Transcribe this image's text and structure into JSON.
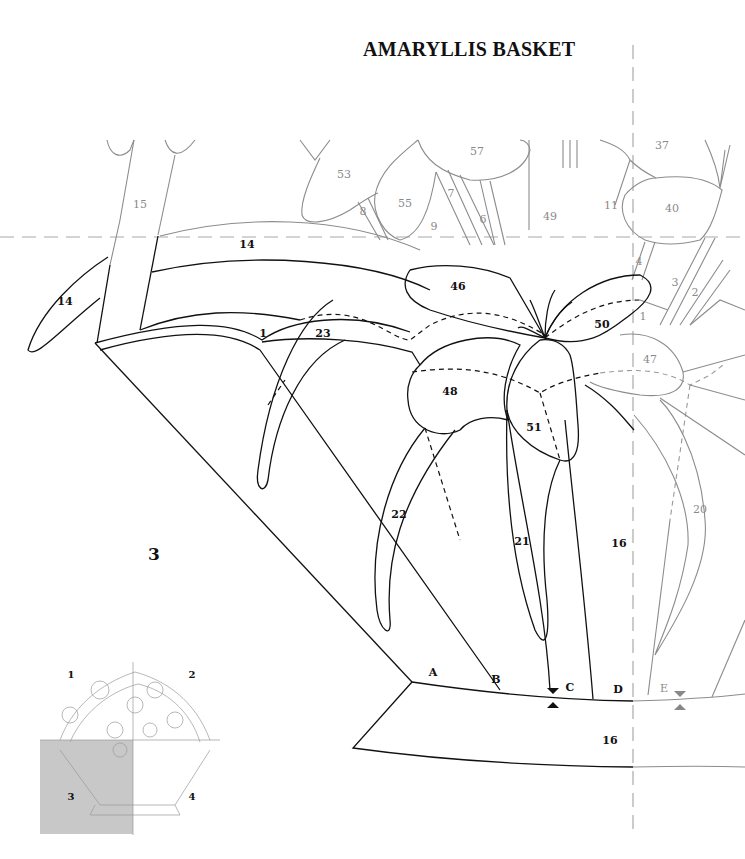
{
  "title": "AMARYLLIS BASKET",
  "section_number": "3",
  "piece_labels": {
    "black": [
      {
        "id": "p14a",
        "text": "14",
        "x": 247,
        "y": 244
      },
      {
        "id": "p14b",
        "text": "14",
        "x": 65,
        "y": 301
      },
      {
        "id": "p1",
        "text": "1",
        "x": 263,
        "y": 333
      },
      {
        "id": "p23",
        "text": "23",
        "x": 323,
        "y": 333
      },
      {
        "id": "p46",
        "text": "46",
        "x": 458,
        "y": 286
      },
      {
        "id": "p50",
        "text": "50",
        "x": 602,
        "y": 324
      },
      {
        "id": "p48",
        "text": "48",
        "x": 450,
        "y": 391
      },
      {
        "id": "p51",
        "text": "51",
        "x": 534,
        "y": 427
      },
      {
        "id": "p22",
        "text": "22",
        "x": 399,
        "y": 514
      },
      {
        "id": "p21",
        "text": "21",
        "x": 522,
        "y": 541
      },
      {
        "id": "p16a",
        "text": "16",
        "x": 619,
        "y": 543
      },
      {
        "id": "p16b",
        "text": "16",
        "x": 610,
        "y": 740
      }
    ],
    "gray": [
      {
        "id": "p15",
        "text": "15",
        "x": 140,
        "y": 204
      },
      {
        "id": "p53",
        "text": "53",
        "x": 344,
        "y": 174
      },
      {
        "id": "p57",
        "text": "57",
        "x": 477,
        "y": 151
      },
      {
        "id": "p55",
        "text": "55",
        "x": 405,
        "y": 203
      },
      {
        "id": "p8",
        "text": "8",
        "x": 363,
        "y": 211
      },
      {
        "id": "p7",
        "text": "7",
        "x": 451,
        "y": 193
      },
      {
        "id": "p9",
        "text": "9",
        "x": 434,
        "y": 226
      },
      {
        "id": "p6",
        "text": "6",
        "x": 483,
        "y": 219
      },
      {
        "id": "p49",
        "text": "49",
        "x": 550,
        "y": 216
      },
      {
        "id": "p11",
        "text": "11",
        "x": 611,
        "y": 205
      },
      {
        "id": "p37",
        "text": "37",
        "x": 662,
        "y": 145
      },
      {
        "id": "p40",
        "text": "40",
        "x": 672,
        "y": 208
      },
      {
        "id": "p4",
        "text": "4",
        "x": 639,
        "y": 261
      },
      {
        "id": "p3",
        "text": "3",
        "x": 675,
        "y": 282
      },
      {
        "id": "p2",
        "text": "2",
        "x": 695,
        "y": 292
      },
      {
        "id": "p1g",
        "text": "1",
        "x": 643,
        "y": 316
      },
      {
        "id": "p47",
        "text": "47",
        "x": 650,
        "y": 359
      },
      {
        "id": "p20",
        "text": "20",
        "x": 700,
        "y": 509
      }
    ]
  },
  "alignment_marks": [
    {
      "text": "A",
      "x": 433,
      "y": 672,
      "tone": "dark"
    },
    {
      "text": "B",
      "x": 496,
      "y": 679,
      "tone": "dark"
    },
    {
      "text": "C",
      "x": 570,
      "y": 687,
      "tone": "dark"
    },
    {
      "text": "D",
      "x": 618,
      "y": 689,
      "tone": "dark"
    },
    {
      "text": "E",
      "x": 664,
      "y": 688,
      "tone": "gray"
    }
  ],
  "key_map": {
    "quadrants": [
      {
        "text": "1",
        "x": 71,
        "y": 674
      },
      {
        "text": "2",
        "x": 192,
        "y": 674
      },
      {
        "text": "3",
        "x": 71,
        "y": 796
      },
      {
        "text": "4",
        "x": 192,
        "y": 796
      }
    ],
    "highlighted_quadrant": "3",
    "highlight_color": "#c8c8c8"
  },
  "colors": {
    "line_current": "#111111",
    "line_adjacent": "#8c8c8c",
    "cut_line": "#aaaaaa"
  }
}
